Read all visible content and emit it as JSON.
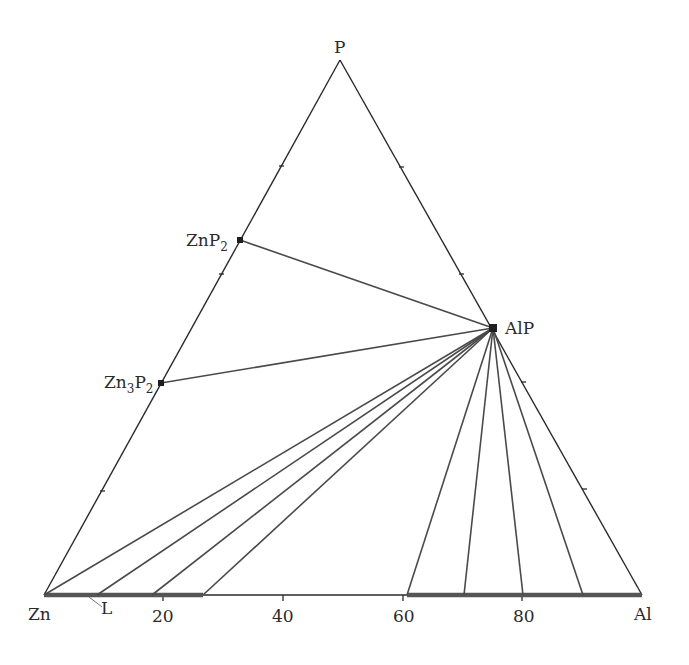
{
  "diagram": {
    "type": "ternary-phase-diagram",
    "vertices": {
      "top": "P",
      "left": "Zn",
      "right": "Al"
    },
    "base_axis": {
      "ticks": [
        "20",
        "40",
        "60",
        "80"
      ],
      "tick_values": [
        20,
        40,
        60,
        80
      ]
    },
    "compounds": [
      {
        "name": "ZnP",
        "sub": "2",
        "label": "ZnP2"
      },
      {
        "name": "Zn",
        "sub_mid": "3",
        "name2": "P",
        "sub": "2",
        "label": "Zn3P2"
      },
      {
        "name": "AlP",
        "label": "AlP"
      }
    ],
    "liquid_label": "L",
    "tie_lines": {
      "from_AlP_to": [
        "ZnP2",
        "Zn3P2",
        "P-Al edge"
      ],
      "to_base_at_pct_Al_left": [
        0,
        8.9,
        18,
        26.6
      ],
      "to_base_at_pct_Al_right": [
        60.7,
        70.2,
        80,
        90.1,
        100
      ]
    },
    "liquid_regions_pct_Al": [
      [
        0,
        26.6
      ],
      [
        60.7,
        100
      ]
    ]
  }
}
